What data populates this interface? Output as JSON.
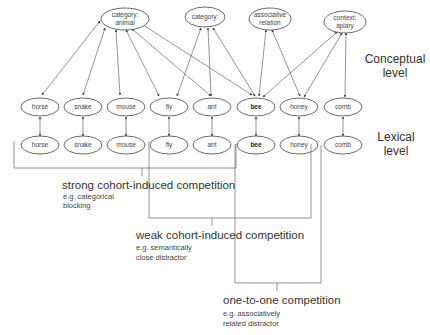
{
  "diagram": {
    "levels": {
      "conceptual": [
        "Conceptual",
        "level"
      ],
      "lexical": [
        "Lexical",
        "level"
      ]
    },
    "concept_nodes": [
      {
        "id": "category-animal",
        "lines": [
          "category:",
          "animal"
        ]
      },
      {
        "id": "category-insect",
        "lines": [
          "category:",
          ""
        ]
      },
      {
        "id": "associative-relation",
        "lines": [
          "associative",
          "relation"
        ]
      },
      {
        "id": "context-apiary",
        "lines": [
          "context:",
          "apiary"
        ]
      }
    ],
    "conceptual_words": [
      "horse",
      "snake",
      "mouse",
      "fly",
      "ant",
      "bee",
      "honey",
      "comb"
    ],
    "lexical_words": [
      "horse",
      "snake",
      "mouse",
      "fly",
      "ant",
      "bee",
      "honey",
      "comb"
    ],
    "target_word": "bee",
    "competition": [
      {
        "title": "strong cohort-induced competition",
        "example": [
          "e.g. categorical",
          "blocking"
        ]
      },
      {
        "title": "weak cohort-induced competition",
        "example": [
          "e.g. semantically",
          "close distractor"
        ]
      },
      {
        "title": "one-to-one competition",
        "example": [
          "e.g. associatively",
          "related distractor"
        ]
      }
    ]
  }
}
